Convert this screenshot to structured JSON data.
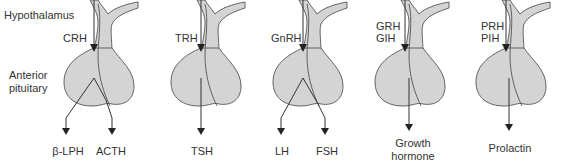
{
  "figure": {
    "labels": {
      "hypothalamus": "Hypothalamus",
      "anterior_pituitary_line1": "Anterior",
      "anterior_pituitary_line2": "pituitary"
    },
    "panels": [
      {
        "releasing": [
          "CRH"
        ],
        "products": [
          "β-LPH",
          "ACTH"
        ]
      },
      {
        "releasing": [
          "TRH"
        ],
        "products": [
          "TSH"
        ]
      },
      {
        "releasing": [
          "GnRH"
        ],
        "products": [
          "LH",
          "FSH"
        ]
      },
      {
        "releasing": [
          "GRH",
          "GIH"
        ],
        "products": [
          "Growth",
          "hormone"
        ],
        "product_single": "Growth hormone"
      },
      {
        "releasing": [
          "PRH",
          "PIH"
        ],
        "products": [
          "Prolactin"
        ]
      }
    ]
  },
  "colors": {
    "gland_fill": "#d4d4d4",
    "outline": "#555555",
    "arrow": "#222222",
    "text": "#333333"
  }
}
